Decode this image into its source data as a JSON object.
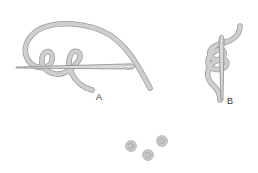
{
  "figure": {
    "labels": {
      "a": "A",
      "b": "B"
    },
    "colors": {
      "thread": "#c8c8c8",
      "thread_outline": "#9a9a9a",
      "needle": "#a8a8a8",
      "knot": "#c4c4c4"
    }
  }
}
